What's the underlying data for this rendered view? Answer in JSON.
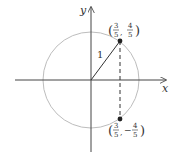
{
  "diagram": {
    "axes": {
      "x_label": "x",
      "y_label": "y"
    },
    "circle": {
      "type": "unit circle",
      "center": [
        0,
        0
      ],
      "radius": 1,
      "color": "#bdbdbd"
    },
    "radius_label": "1",
    "points": [
      {
        "name": "upper",
        "coords": [
          0.6,
          0.8
        ],
        "label_open": "(",
        "label_x_num": "3",
        "label_x_den": "5",
        "label_sep": ",",
        "label_y_sign": "",
        "label_y_num": "4",
        "label_y_den": "5",
        "label_close": ")"
      },
      {
        "name": "lower",
        "coords": [
          0.6,
          -0.8
        ],
        "label_open": "(",
        "label_x_num": "3",
        "label_x_den": "5",
        "label_sep": ",",
        "label_y_sign": "−",
        "label_y_num": "4",
        "label_y_den": "5",
        "label_close": ")"
      }
    ],
    "dashed_segment": "vertical line x = 3/5 from upper point to lower point"
  }
}
